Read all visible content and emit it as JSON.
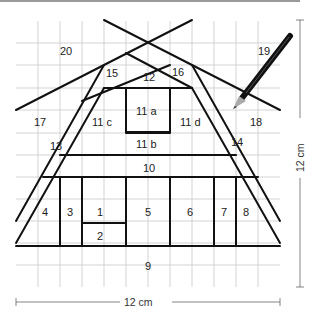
{
  "diagram": {
    "grid": {
      "cells": 12,
      "cell_size_px": 22,
      "origin_x": 16,
      "origin_y": 21
    },
    "dimensions": {
      "width_label": "12 cm",
      "height_label": "12 cm"
    },
    "pieces": [
      {
        "id": "1",
        "label": "1"
      },
      {
        "id": "2",
        "label": "2"
      },
      {
        "id": "3",
        "label": "3"
      },
      {
        "id": "4",
        "label": "4"
      },
      {
        "id": "5",
        "label": "5"
      },
      {
        "id": "6",
        "label": "6"
      },
      {
        "id": "7",
        "label": "7"
      },
      {
        "id": "8",
        "label": "8"
      },
      {
        "id": "9",
        "label": "9"
      },
      {
        "id": "10",
        "label": "10"
      },
      {
        "id": "11a",
        "label": "11 a"
      },
      {
        "id": "11b",
        "label": "11 b"
      },
      {
        "id": "11c",
        "label": "11 c"
      },
      {
        "id": "11d",
        "label": "11 d"
      },
      {
        "id": "12",
        "label": "12"
      },
      {
        "id": "13",
        "label": "13"
      },
      {
        "id": "14",
        "label": "14"
      },
      {
        "id": "15",
        "label": "15"
      },
      {
        "id": "16",
        "label": "16"
      },
      {
        "id": "17",
        "label": "17"
      },
      {
        "id": "18",
        "label": "18"
      },
      {
        "id": "19",
        "label": "19"
      },
      {
        "id": "20",
        "label": "20"
      }
    ],
    "icons": {
      "pencil": "pencil-icon"
    },
    "colors": {
      "grid": "#c8c8c8",
      "lines": "#111111",
      "text": "#222222",
      "dimension": "#555555"
    }
  }
}
